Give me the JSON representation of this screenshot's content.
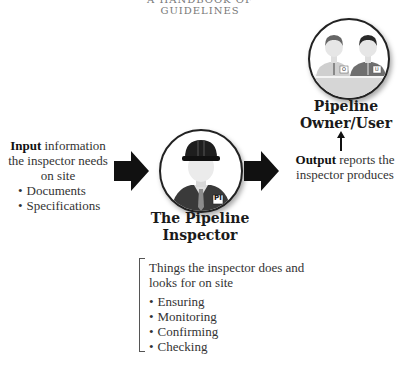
{
  "header": {
    "partial_title": "A HANDBOOK OF GUIDELINES"
  },
  "input": {
    "keyword": "Input",
    "description": " information the inspector needs on site",
    "items": [
      "Documents",
      "Specifications"
    ]
  },
  "inspector": {
    "title_line1": "The Pipeline",
    "title_line2": "Inspector",
    "badge": "PI",
    "icon": "inspector-with-hard-hat-icon"
  },
  "owner": {
    "title_line1": "Pipeline",
    "title_line2": "Owner/User",
    "badges": [
      "O",
      "U"
    ],
    "icon": "owner-and-user-icon"
  },
  "output": {
    "keyword": "Output",
    "description": " reports the inspector produces"
  },
  "activities": {
    "intro": "Things the inspector does and looks for on site",
    "items": [
      "Ensuring",
      "Monitoring",
      "Confirming",
      "Checking"
    ]
  },
  "colors": {
    "arrow": "#111111",
    "helmet": "#1e1e1e",
    "suit_dark": "#3a3a3a",
    "person_light": "#bdbdbd",
    "face": "#e9e9e9"
  }
}
